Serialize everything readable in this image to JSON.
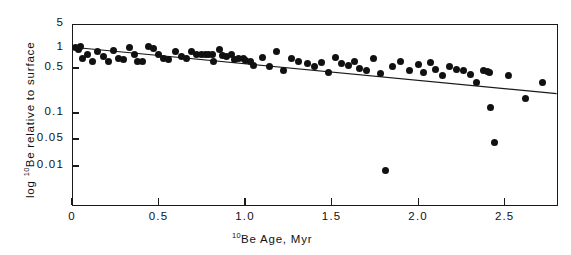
{
  "chart_data": {
    "type": "scatter",
    "title": "",
    "xlabel": "10Be Age, Myr",
    "ylabel": "log 10Be relative to surface",
    "xlabel_parts": {
      "sup": "10",
      "rest": "Be Age, Myr"
    },
    "ylabel_parts": {
      "pre": "log ",
      "sup": "10",
      "rest": "Be relative to surface"
    },
    "grid": false,
    "legend": "none",
    "xscale": "linear",
    "yscale": "log",
    "xlim": [
      0,
      2.8
    ],
    "ylim": [
      0.007,
      5
    ],
    "xticks": [
      0,
      0.5,
      1.0,
      1.5,
      2.0,
      2.5
    ],
    "xticklabels": [
      "0",
      "0.5",
      "1.0",
      "1.5",
      "2.0",
      "2.5"
    ],
    "yticks": [
      5,
      1,
      0.5,
      0.1,
      0.05,
      0.01
    ],
    "yticklabels": [
      "5",
      "1",
      "0.5",
      "0.1",
      "0.05",
      "0.01"
    ],
    "marker": "filled-circle",
    "marker_color": "#111111",
    "marker_size_px": 7,
    "fit_line": {
      "label": "regression line",
      "color": "#1a1a1a",
      "x": [
        0.02,
        2.8
      ],
      "y": [
        1.0,
        0.2
      ]
    },
    "points": [
      {
        "x": 0.02,
        "y": 1.02
      },
      {
        "x": 0.04,
        "y": 0.92
      },
      {
        "x": 0.05,
        "y": 1.05
      },
      {
        "x": 0.06,
        "y": 0.7
      },
      {
        "x": 0.09,
        "y": 0.8
      },
      {
        "x": 0.12,
        "y": 0.63
      },
      {
        "x": 0.15,
        "y": 0.88
      },
      {
        "x": 0.18,
        "y": 0.74
      },
      {
        "x": 0.21,
        "y": 0.62
      },
      {
        "x": 0.24,
        "y": 0.9
      },
      {
        "x": 0.27,
        "y": 0.7
      },
      {
        "x": 0.3,
        "y": 0.66
      },
      {
        "x": 0.33,
        "y": 1.0
      },
      {
        "x": 0.36,
        "y": 0.8
      },
      {
        "x": 0.38,
        "y": 0.63
      },
      {
        "x": 0.41,
        "y": 0.62
      },
      {
        "x": 0.44,
        "y": 1.05
      },
      {
        "x": 0.47,
        "y": 0.97
      },
      {
        "x": 0.5,
        "y": 0.78
      },
      {
        "x": 0.53,
        "y": 0.7
      },
      {
        "x": 0.56,
        "y": 0.66
      },
      {
        "x": 0.6,
        "y": 0.86
      },
      {
        "x": 0.63,
        "y": 0.74
      },
      {
        "x": 0.66,
        "y": 0.7
      },
      {
        "x": 0.69,
        "y": 0.88
      },
      {
        "x": 0.72,
        "y": 0.8
      },
      {
        "x": 0.75,
        "y": 0.78
      },
      {
        "x": 0.77,
        "y": 0.79
      },
      {
        "x": 0.79,
        "y": 0.8
      },
      {
        "x": 0.81,
        "y": 0.78
      },
      {
        "x": 0.82,
        "y": 0.62
      },
      {
        "x": 0.85,
        "y": 0.95
      },
      {
        "x": 0.87,
        "y": 0.76
      },
      {
        "x": 0.89,
        "y": 0.74
      },
      {
        "x": 0.92,
        "y": 0.78
      },
      {
        "x": 0.94,
        "y": 0.66
      },
      {
        "x": 0.96,
        "y": 0.68
      },
      {
        "x": 0.99,
        "y": 0.7
      },
      {
        "x": 1.0,
        "y": 0.64
      },
      {
        "x": 1.03,
        "y": 0.62
      },
      {
        "x": 1.05,
        "y": 0.55
      },
      {
        "x": 1.1,
        "y": 0.72
      },
      {
        "x": 1.14,
        "y": 0.52
      },
      {
        "x": 1.18,
        "y": 0.88
      },
      {
        "x": 1.22,
        "y": 0.45
      },
      {
        "x": 1.27,
        "y": 0.7
      },
      {
        "x": 1.31,
        "y": 0.62
      },
      {
        "x": 1.36,
        "y": 0.58
      },
      {
        "x": 1.4,
        "y": 0.52
      },
      {
        "x": 1.44,
        "y": 0.6
      },
      {
        "x": 1.48,
        "y": 0.43
      },
      {
        "x": 1.52,
        "y": 0.72
      },
      {
        "x": 1.56,
        "y": 0.58
      },
      {
        "x": 1.6,
        "y": 0.55
      },
      {
        "x": 1.63,
        "y": 0.62
      },
      {
        "x": 1.66,
        "y": 0.5
      },
      {
        "x": 1.7,
        "y": 0.46
      },
      {
        "x": 1.74,
        "y": 0.7
      },
      {
        "x": 1.78,
        "y": 0.41
      },
      {
        "x": 1.81,
        "y": 0.0075
      },
      {
        "x": 1.85,
        "y": 0.52
      },
      {
        "x": 1.9,
        "y": 0.63
      },
      {
        "x": 1.95,
        "y": 0.46
      },
      {
        "x": 2.0,
        "y": 0.56
      },
      {
        "x": 2.03,
        "y": 0.43
      },
      {
        "x": 2.07,
        "y": 0.6
      },
      {
        "x": 2.1,
        "y": 0.48
      },
      {
        "x": 2.14,
        "y": 0.38
      },
      {
        "x": 2.18,
        "y": 0.52
      },
      {
        "x": 2.22,
        "y": 0.47
      },
      {
        "x": 2.26,
        "y": 0.46
      },
      {
        "x": 2.3,
        "y": 0.39
      },
      {
        "x": 2.34,
        "y": 0.3
      },
      {
        "x": 2.38,
        "y": 0.45
      },
      {
        "x": 2.4,
        "y": 0.44
      },
      {
        "x": 2.41,
        "y": 0.43
      },
      {
        "x": 2.42,
        "y": 0.12
      },
      {
        "x": 2.44,
        "y": 0.04
      },
      {
        "x": 2.52,
        "y": 0.38
      },
      {
        "x": 2.62,
        "y": 0.17
      },
      {
        "x": 2.72,
        "y": 0.3
      }
    ]
  }
}
